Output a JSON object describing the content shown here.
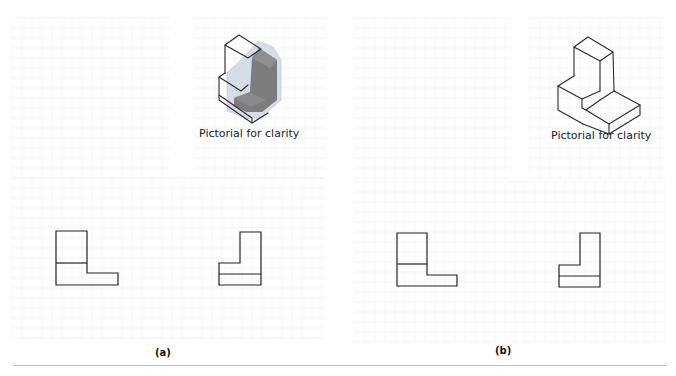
{
  "figure": {
    "panels": [
      {
        "id": "a",
        "label": "(a)",
        "pictorial_caption": "Pictorial for clarity",
        "pictorial_style": "shaded-transparent",
        "front_view": "L-shape with one horizontal division line",
        "side_view": "inverted L-shape with one horizontal division line"
      },
      {
        "id": "b",
        "label": "(b)",
        "pictorial_caption": "Pictorial for clarity",
        "pictorial_style": "line-sketch",
        "front_view": "L-shape with one horizontal division line",
        "side_view": "inverted L-shape with one horizontal division line"
      }
    ],
    "colors": {
      "line": "#222222",
      "shade_dark": "#7d7d7f",
      "shade_light": "#c7d1e2",
      "grid": "#ececec",
      "divider": "#bdbdbd"
    }
  }
}
